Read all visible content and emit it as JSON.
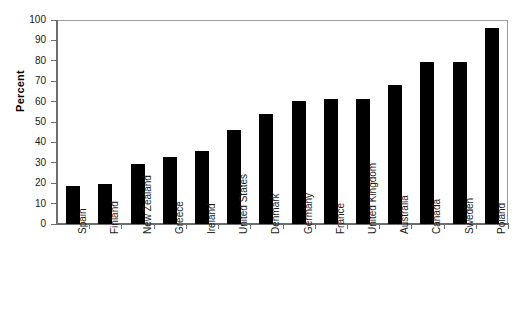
{
  "chart_data": {
    "type": "bar",
    "title": "",
    "subtitle": "",
    "xlabel": "",
    "ylabel": "Percent",
    "ylim": [
      0,
      100
    ],
    "yticks": [
      0,
      10,
      20,
      30,
      40,
      50,
      60,
      70,
      80,
      90,
      100
    ],
    "ytick_labels": [
      "0",
      "10",
      "20",
      "30",
      "40",
      "50",
      "60",
      "70",
      "80",
      "90",
      "100"
    ],
    "grid": false,
    "legend": false,
    "legend_position": "none",
    "bar_color": "#000000",
    "plot_background": "#ffffff",
    "axis_color": "#6e6e6e",
    "categories": [
      "Spain",
      "Finland",
      "New Zealand",
      "Greece",
      "Ireland",
      "United States",
      "Denmark",
      "Germany",
      "France",
      "United Kingdom",
      "Australia",
      "Canada",
      "Sweden",
      "Poland"
    ],
    "values": [
      18.5,
      19.8,
      29.4,
      32.8,
      36.0,
      46.0,
      53.8,
      60.2,
      61.2,
      61.2,
      68.0,
      79.2,
      79.5,
      96.0
    ]
  }
}
